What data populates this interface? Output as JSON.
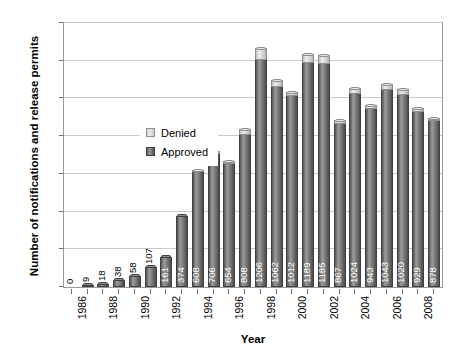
{
  "chart_data": {
    "type": "bar",
    "subtype": "stacked-column",
    "title": "",
    "xlabel": "Year",
    "ylabel": "Number of notifications and release permits",
    "ylim": [
      0,
      1400
    ],
    "ytick_values": [
      0,
      200,
      400,
      600,
      800,
      1000,
      1200,
      1400
    ],
    "ytick_labels": [
      "0",
      "200",
      "400",
      "600",
      "800",
      "1,000",
      "1,200",
      "1,400"
    ],
    "grid": true,
    "legend_position": "upper-left-inside",
    "categories": [
      "1986",
      "1987",
      "1988",
      "1989",
      "1990",
      "1991",
      "1992",
      "1993",
      "1994",
      "1995",
      "1996",
      "1997",
      "1998",
      "1999",
      "2000",
      "2001",
      "2002",
      "2003",
      "2004",
      "2005",
      "2006",
      "2007",
      "2008",
      "2009"
    ],
    "xtick_labels": [
      "1986",
      "",
      "1988",
      "",
      "1990",
      "",
      "1992",
      "",
      "1994",
      "",
      "1996",
      "",
      "1998",
      "",
      "2000",
      "",
      "2002",
      "",
      "2004",
      "",
      "2006",
      "",
      "2008",
      ""
    ],
    "series": [
      {
        "name": "Approved",
        "color": "#6f6f6f",
        "values": [
          0,
          9,
          18,
          38,
          58,
          107,
          161,
          374,
          608,
          706,
          654,
          808,
          1206,
          1062,
          1012,
          1189,
          1185,
          867,
          1024,
          943,
          1043,
          1020,
          929,
          878
        ]
      },
      {
        "name": "Denied",
        "color": "#d8d8d8",
        "values": [
          0,
          0,
          0,
          0,
          0,
          0,
          0,
          0,
          12,
          14,
          16,
          30,
          60,
          38,
          22,
          48,
          46,
          18,
          34,
          20,
          36,
          28,
          22,
          16
        ]
      }
    ],
    "data_labels": [
      {
        "text": "0",
        "position": "outside"
      },
      {
        "text": "9",
        "position": "outside"
      },
      {
        "text": "18",
        "position": "outside"
      },
      {
        "text": "38",
        "position": "outside"
      },
      {
        "text": "58",
        "position": "outside"
      },
      {
        "text": "107",
        "position": "outside"
      },
      {
        "text": "161",
        "position": "inside"
      },
      {
        "text": "374",
        "position": "inside"
      },
      {
        "text": "608",
        "position": "inside"
      },
      {
        "text": "706",
        "position": "inside"
      },
      {
        "text": "654",
        "position": "inside"
      },
      {
        "text": "808",
        "position": "inside"
      },
      {
        "text": "1206",
        "position": "inside"
      },
      {
        "text": "1062",
        "position": "inside"
      },
      {
        "text": "1012",
        "position": "inside"
      },
      {
        "text": "1189",
        "position": "inside"
      },
      {
        "text": "1185",
        "position": "inside"
      },
      {
        "text": "867",
        "position": "inside"
      },
      {
        "text": "1024",
        "position": "inside"
      },
      {
        "text": "943",
        "position": "inside"
      },
      {
        "text": "1043",
        "position": "inside"
      },
      {
        "text": "1020",
        "position": "inside"
      },
      {
        "text": "929",
        "position": "inside"
      },
      {
        "text": "878",
        "position": "inside"
      }
    ]
  },
  "legend": {
    "items": [
      {
        "label": "Denied"
      },
      {
        "label": "Approved"
      }
    ]
  }
}
